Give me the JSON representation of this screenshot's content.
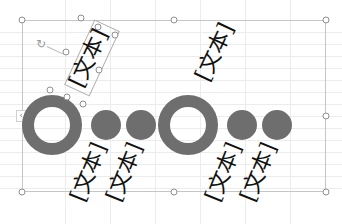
{
  "canvas": {
    "background": "#ffffff",
    "gridline_color": "#ececec",
    "shape_color": "#6e6e6e",
    "frame_color": "#c6c6c6"
  },
  "frame": {
    "left_tab_glyph": "‹"
  },
  "selection": {
    "rotate_handle_glyph": "↻"
  },
  "text_boxes": [
    {
      "id": "tb-top-left",
      "text": "[文本]",
      "selected": true
    },
    {
      "id": "tb-top-right",
      "text": "[文本]",
      "selected": false
    },
    {
      "id": "tb-bottom-1",
      "text": "[文本]",
      "selected": false
    },
    {
      "id": "tb-bottom-2",
      "text": "[文本]",
      "selected": false
    },
    {
      "id": "tb-bottom-3",
      "text": "[文本]",
      "selected": false
    },
    {
      "id": "tb-bottom-4",
      "text": "[文本]",
      "selected": false
    }
  ],
  "shapes": [
    {
      "type": "ring",
      "group": 1
    },
    {
      "type": "circle",
      "group": 1
    },
    {
      "type": "circle",
      "group": 1
    },
    {
      "type": "ring",
      "group": 2
    },
    {
      "type": "circle",
      "group": 2
    },
    {
      "type": "circle",
      "group": 2
    }
  ]
}
